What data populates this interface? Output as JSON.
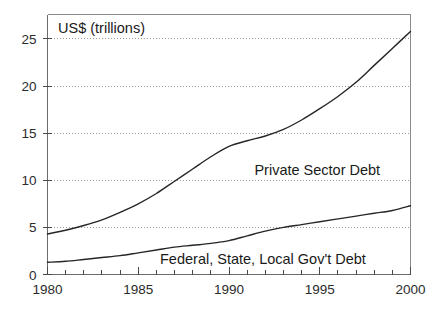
{
  "chart_data": {
    "type": "line",
    "title": "",
    "ylabel": "US$ (trillions)",
    "xlabel": "",
    "xlim": [
      1980,
      2000
    ],
    "ylim": [
      0,
      27.6
    ],
    "grid": true,
    "legend_position": "inline-annotation",
    "x_ticks": [
      1980,
      1985,
      1990,
      1995,
      2000
    ],
    "x_tick_labels": [
      "1980",
      "1985",
      "1990",
      "1995",
      "2000"
    ],
    "x_minor_tick_step": 1,
    "y_ticks": [
      0,
      5,
      10,
      15,
      20,
      25
    ],
    "y_tick_labels": [
      "0",
      "5",
      "10",
      "15",
      "20",
      "25"
    ],
    "line_color": "#262626",
    "grid_color": "#9a9a9a",
    "frame_color": "#8a8a8a",
    "x": [
      1980,
      1981,
      1982,
      1983,
      1984,
      1985,
      1986,
      1987,
      1988,
      1989,
      1990,
      1991,
      1992,
      1993,
      1994,
      1995,
      1996,
      1997,
      1998,
      1999,
      2000
    ],
    "series": [
      {
        "name": "Private Sector Debt",
        "label": "Private Sector Debt",
        "label_x": 1991.4,
        "label_y": 10.6,
        "values": [
          4.3,
          4.7,
          5.2,
          5.8,
          6.6,
          7.5,
          8.6,
          9.9,
          11.2,
          12.5,
          13.6,
          14.2,
          14.7,
          15.4,
          16.4,
          17.6,
          18.9,
          20.4,
          22.2,
          24.0,
          25.8
        ]
      },
      {
        "name": "Federal, State, Local Gov't Debt",
        "label": "Federal, State, Local Gov't Debt",
        "label_x": 1986.2,
        "label_y": 1.1,
        "values": [
          1.3,
          1.4,
          1.6,
          1.8,
          2.0,
          2.3,
          2.6,
          2.9,
          3.1,
          3.3,
          3.6,
          4.1,
          4.6,
          5.0,
          5.3,
          5.6,
          5.9,
          6.2,
          6.5,
          6.8,
          7.3
        ]
      }
    ]
  },
  "a11y": {
    "chart_region_name": "us-debt-line-chart"
  }
}
